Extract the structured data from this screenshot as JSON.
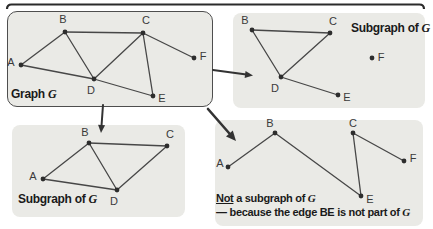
{
  "figure_title": "Graph and subgraph examples",
  "colors": {
    "background": "#ffffff",
    "panel_fill": "#eaeae6",
    "panel_border": "#4e4e4e",
    "edge": "#474747",
    "dot": "#2d2d2d",
    "vertex_label": "#3a3a3a",
    "caption": "#1a1a1a",
    "arrow": "#333333",
    "top_rule": "#2b2b2b"
  },
  "top_rule": {
    "x1": 7,
    "x2": 424,
    "y": 4.5,
    "hook": 4.5,
    "width": 2.2
  },
  "style": {
    "dot_radius": 2.4,
    "edge_width": 1.3,
    "vertex_font_size": 11
  },
  "panels": [
    {
      "id": "graph-g",
      "box": {
        "x": 7,
        "y": 11,
        "w": 206,
        "h": 96,
        "r": 10,
        "bordered": true
      },
      "captions": [
        {
          "x": 11,
          "y": 88,
          "size": 12,
          "parts": [
            {
              "t": "Graph "
            },
            {
              "t": "G",
              "vg": true
            }
          ]
        }
      ],
      "vertices": [
        {
          "id": "A",
          "x": 21,
          "y": 65,
          "lx": 11,
          "ly": 62
        },
        {
          "id": "B",
          "x": 65,
          "y": 32,
          "lx": 63,
          "ly": 19
        },
        {
          "id": "C",
          "x": 143,
          "y": 33,
          "lx": 146,
          "ly": 20
        },
        {
          "id": "D",
          "x": 94,
          "y": 79,
          "lx": 91,
          "ly": 90
        },
        {
          "id": "E",
          "x": 153,
          "y": 96,
          "lx": 162,
          "ly": 98
        },
        {
          "id": "F",
          "x": 194,
          "y": 58,
          "lx": 203,
          "ly": 56
        }
      ],
      "edges": [
        [
          "A",
          "B"
        ],
        [
          "A",
          "D"
        ],
        [
          "B",
          "C"
        ],
        [
          "B",
          "D"
        ],
        [
          "C",
          "D"
        ],
        [
          "C",
          "E"
        ],
        [
          "C",
          "F"
        ],
        [
          "D",
          "E"
        ]
      ]
    },
    {
      "id": "subgraph-right",
      "box": {
        "x": 233,
        "y": 13,
        "w": 192,
        "h": 95,
        "r": 8,
        "bordered": false
      },
      "captions": [
        {
          "x": 351,
          "y": 22,
          "size": 12,
          "parts": [
            {
              "t": "Subgraph of "
            },
            {
              "t": "G",
              "vg": true
            }
          ]
        }
      ],
      "vertices": [
        {
          "id": "B",
          "x": 252,
          "y": 30,
          "lx": 245,
          "ly": 20
        },
        {
          "id": "C",
          "x": 330,
          "y": 33,
          "lx": 333,
          "ly": 21
        },
        {
          "id": "D",
          "x": 281,
          "y": 77,
          "lx": 275,
          "ly": 88
        },
        {
          "id": "E",
          "x": 338,
          "y": 95,
          "lx": 347,
          "ly": 97
        },
        {
          "id": "F",
          "x": 372,
          "y": 58,
          "lx": 381,
          "ly": 57
        }
      ],
      "edges": [
        [
          "B",
          "C"
        ],
        [
          "B",
          "D"
        ],
        [
          "C",
          "D"
        ],
        [
          "D",
          "E"
        ]
      ]
    },
    {
      "id": "subgraph-bottom",
      "box": {
        "x": 12,
        "y": 125,
        "w": 173,
        "h": 92,
        "r": 8,
        "bordered": false
      },
      "captions": [
        {
          "x": 18,
          "y": 193,
          "size": 12,
          "parts": [
            {
              "t": "Subgraph of "
            },
            {
              "t": "G",
              "vg": true
            }
          ]
        }
      ],
      "vertices": [
        {
          "id": "A",
          "x": 43,
          "y": 179,
          "lx": 33,
          "ly": 176
        },
        {
          "id": "B",
          "x": 89,
          "y": 143,
          "lx": 85,
          "ly": 132
        },
        {
          "id": "C",
          "x": 167,
          "y": 146,
          "lx": 170,
          "ly": 134
        },
        {
          "id": "D",
          "x": 117,
          "y": 190,
          "lx": 114,
          "ly": 201
        }
      ],
      "edges": [
        [
          "A",
          "B"
        ],
        [
          "A",
          "D"
        ],
        [
          "B",
          "C"
        ],
        [
          "B",
          "D"
        ],
        [
          "C",
          "D"
        ]
      ]
    },
    {
      "id": "not-subgraph",
      "box": {
        "x": 215,
        "y": 120,
        "w": 208,
        "h": 106,
        "r": 8,
        "bordered": false
      },
      "captions": [
        {
          "x": 216,
          "y": 192,
          "size": 11,
          "parts": [
            {
              "t": "Not",
              "ul": true
            },
            {
              "t": " a subgraph of "
            },
            {
              "t": "G",
              "vg": true
            }
          ]
        },
        {
          "x": 216,
          "y": 206,
          "size": 11,
          "parts": [
            {
              "t": "— because the edge BE is not part of "
            },
            {
              "t": "G",
              "vg": true
            }
          ]
        }
      ],
      "vertices": [
        {
          "id": "A",
          "x": 228,
          "y": 167,
          "lx": 220,
          "ly": 163
        },
        {
          "id": "B",
          "x": 275,
          "y": 133,
          "lx": 270,
          "ly": 123
        },
        {
          "id": "C",
          "x": 353,
          "y": 133,
          "lx": 353,
          "ly": 123
        },
        {
          "id": "E",
          "x": 361,
          "y": 196,
          "lx": 370,
          "ly": 199
        },
        {
          "id": "F",
          "x": 404,
          "y": 161,
          "lx": 413,
          "ly": 158
        }
      ],
      "edges": [
        [
          "A",
          "B"
        ],
        [
          "B",
          "E"
        ],
        [
          "C",
          "E"
        ],
        [
          "C",
          "F"
        ]
      ]
    }
  ],
  "arrows": [
    {
      "name": "arrow-to-subgraph-right",
      "x1": 213,
      "y1": 70,
      "x2": 253,
      "y2": 75.5,
      "w": 2,
      "head_l": 8,
      "head_w": 7
    },
    {
      "name": "arrow-to-subgraph-bottom",
      "x1": 103,
      "y1": 105,
      "x2": 101,
      "y2": 133,
      "w": 2,
      "head_l": 8,
      "head_w": 7
    },
    {
      "name": "arrow-to-not-subgraph",
      "x1": 208,
      "y1": 109,
      "x2": 236,
      "y2": 141,
      "w": 2.6,
      "head_l": 10,
      "head_w": 9
    }
  ]
}
